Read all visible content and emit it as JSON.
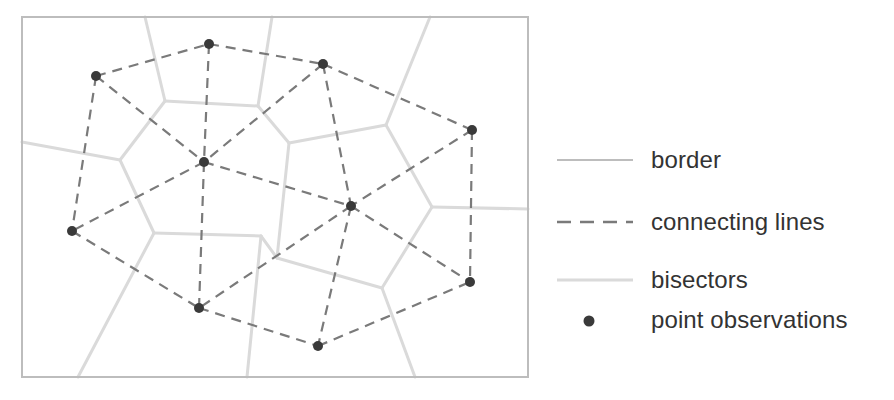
{
  "diagram": {
    "title": "",
    "colors": {
      "border": "#bdbdbd",
      "connecting_lines": "#7a7a7a",
      "bisectors": "#dadada",
      "points": "#3a3a3a",
      "text": "#333333"
    },
    "border_rect": {
      "x": 22,
      "y": 17,
      "width": 506,
      "height": 360
    },
    "points": [
      {
        "id": "P1",
        "x": 96,
        "y": 76
      },
      {
        "id": "P2",
        "x": 209,
        "y": 44
      },
      {
        "id": "P3",
        "x": 323,
        "y": 64
      },
      {
        "id": "P4",
        "x": 472,
        "y": 130
      },
      {
        "id": "P5",
        "x": 204,
        "y": 162
      },
      {
        "id": "P6",
        "x": 351,
        "y": 206
      },
      {
        "id": "P7",
        "x": 72,
        "y": 231
      },
      {
        "id": "P8",
        "x": 199,
        "y": 308
      },
      {
        "id": "P9",
        "x": 470,
        "y": 282
      },
      {
        "id": "P10",
        "x": 318,
        "y": 346
      }
    ],
    "connecting_lines": [
      [
        "P1",
        "P2"
      ],
      [
        "P2",
        "P3"
      ],
      [
        "P3",
        "P4"
      ],
      [
        "P1",
        "P7"
      ],
      [
        "P1",
        "P5"
      ],
      [
        "P2",
        "P5"
      ],
      [
        "P3",
        "P5"
      ],
      [
        "P3",
        "P6"
      ],
      [
        "P5",
        "P6"
      ],
      [
        "P5",
        "P7"
      ],
      [
        "P5",
        "P8"
      ],
      [
        "P4",
        "P6"
      ],
      [
        "P4",
        "P9"
      ],
      [
        "P6",
        "P9"
      ],
      [
        "P6",
        "P8"
      ],
      [
        "P6",
        "P10"
      ],
      [
        "P7",
        "P8"
      ],
      [
        "P8",
        "P10"
      ],
      [
        "P10",
        "P9"
      ]
    ],
    "bisectors": [
      [
        [
          145,
          17
        ],
        [
          165,
          101
        ]
      ],
      [
        [
          272,
          17
        ],
        [
          258,
          106
        ]
      ],
      [
        [
          165,
          101
        ],
        [
          258,
          106
        ]
      ],
      [
        [
          165,
          101
        ],
        [
          120,
          160
        ]
      ],
      [
        [
          22,
          142
        ],
        [
          120,
          160
        ]
      ],
      [
        [
          120,
          160
        ],
        [
          154,
          233
        ]
      ],
      [
        [
          154,
          233
        ],
        [
          78,
          377
        ]
      ],
      [
        [
          154,
          233
        ],
        [
          261,
          236
        ]
      ],
      [
        [
          261,
          236
        ],
        [
          247,
          377
        ]
      ],
      [
        [
          258,
          106
        ],
        [
          289,
          143
        ]
      ],
      [
        [
          261,
          236
        ],
        [
          277,
          258
        ]
      ],
      [
        [
          289,
          143
        ],
        [
          386,
          125
        ]
      ],
      [
        [
          289,
          143
        ],
        [
          277,
          258
        ]
      ],
      [
        [
          430,
          17
        ],
        [
          386,
          125
        ]
      ],
      [
        [
          386,
          125
        ],
        [
          432,
          207
        ]
      ],
      [
        [
          432,
          207
        ],
        [
          528,
          209
        ]
      ],
      [
        [
          432,
          207
        ],
        [
          382,
          288
        ]
      ],
      [
        [
          277,
          258
        ],
        [
          382,
          288
        ]
      ],
      [
        [
          382,
          288
        ],
        [
          415,
          377
        ]
      ]
    ]
  },
  "legend": {
    "items": [
      {
        "key": "border",
        "label": "border"
      },
      {
        "key": "connecting_lines",
        "label": "connecting lines"
      },
      {
        "key": "bisectors",
        "label": "bisectors"
      },
      {
        "key": "points",
        "label": "point observations"
      }
    ]
  }
}
